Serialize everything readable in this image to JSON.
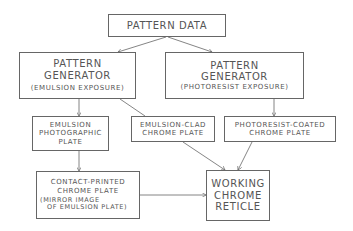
{
  "diagram": {
    "type": "flowchart",
    "nodes": {
      "pattern_data": {
        "line1": "PATTERN DATA"
      },
      "pg_emulsion": {
        "line1": "PATTERN",
        "line2": "GENERATOR",
        "line3": "(EMULSION EXPOSURE)"
      },
      "pg_photoresist": {
        "line1": "PATTERN",
        "line2": "GENERATOR",
        "line3": "(PHOTORESIST EXPOSURE)"
      },
      "emulsion_plate": {
        "line1": "EMULSION",
        "line2": "PHOTOGRAPHIC",
        "line3": "PLATE"
      },
      "emulsion_clad": {
        "line1": "EMULSION-CLAD",
        "line2": "CHROME PLATE"
      },
      "photoresist_coated": {
        "line1": "PHOTORESIST-COATED",
        "line2": "CHROME PLATE"
      },
      "contact_printed": {
        "line1": "CONTACT-PRINTED",
        "line2": "CHROME PLATE",
        "line3": "(MIRROR IMAGE",
        "line4": "OF EMULSION PLATE)"
      },
      "working_reticle": {
        "line1": "WORKING",
        "line2": "CHROME",
        "line3": "RETICLE"
      }
    },
    "edges": [
      [
        "pattern_data",
        "pg_emulsion"
      ],
      [
        "pattern_data",
        "pg_photoresist"
      ],
      [
        "pg_emulsion",
        "emulsion_plate"
      ],
      [
        "pg_emulsion",
        "working_reticle"
      ],
      [
        "pg_photoresist",
        "photoresist_coated"
      ],
      [
        "emulsion_plate",
        "contact_printed"
      ],
      [
        "emulsion_clad",
        "working_reticle"
      ],
      [
        "photoresist_coated",
        "working_reticle"
      ],
      [
        "contact_printed",
        "working_reticle"
      ]
    ]
  }
}
